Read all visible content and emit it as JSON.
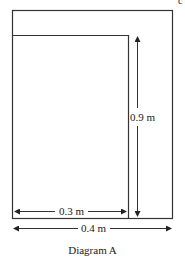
{
  "diagram": {
    "caption": "Diagram A",
    "labels": {
      "height": "0.9 m",
      "inner_width": "0.3 m",
      "outer_width": "0.4 m"
    },
    "corner_mark": "c"
  }
}
